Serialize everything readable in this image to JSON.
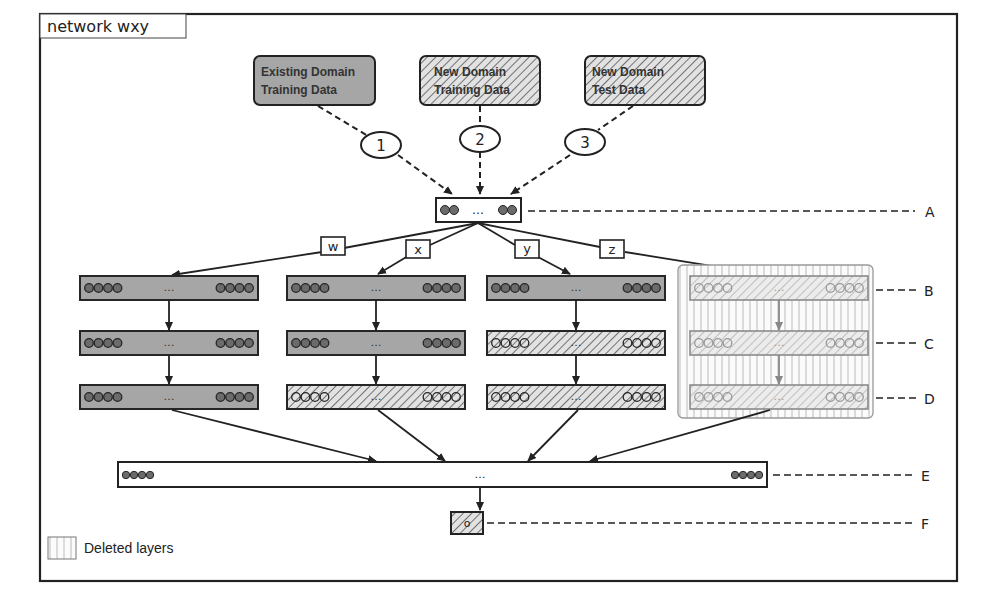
{
  "title": "network wxy",
  "data_sources": [
    {
      "id": "existing",
      "line1": "Existing Domain",
      "line2": "Training Data",
      "style": "solid"
    },
    {
      "id": "new-train",
      "line1": "New Domain",
      "line2": "Training Data",
      "style": "hatched"
    },
    {
      "id": "new-test",
      "line1": "New Domain",
      "line2": "Test Data",
      "style": "hatched"
    }
  ],
  "steps": [
    "1",
    "2",
    "3"
  ],
  "branch_labels": [
    "w",
    "x",
    "y",
    "z"
  ],
  "layer_labels": {
    "A": "A",
    "B": "B",
    "C": "C",
    "D": "D",
    "E": "E",
    "F": "F"
  },
  "ellipsis": "…",
  "output_node": "o",
  "legend": {
    "label": "Deleted layers",
    "icon": "vertical-stripes-swatch"
  },
  "columns": [
    {
      "branch": "w",
      "layers": [
        "solid",
        "solid",
        "solid"
      ],
      "deleted": false
    },
    {
      "branch": "x",
      "layers": [
        "solid",
        "solid",
        "hatched"
      ],
      "deleted": false
    },
    {
      "branch": "y",
      "layers": [
        "solid",
        "hatched",
        "hatched"
      ],
      "deleted": false
    },
    {
      "branch": "z",
      "layers": [
        "hatched",
        "hatched",
        "hatched"
      ],
      "deleted": true
    }
  ],
  "colors": {
    "solid_fill": "#a6a6a6",
    "node_fill": "#6b6b6b",
    "stroke": "#262626",
    "deleted_stroke": "#8a8a8a",
    "background": "#ffffff"
  }
}
